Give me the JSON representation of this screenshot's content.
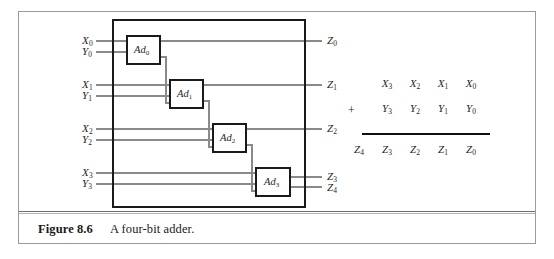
{
  "figure": {
    "caption_label": "Figure 8.6",
    "caption_text": "A four-bit adder.",
    "title": "A four-bit adder"
  },
  "colors": {
    "frame_border": "#9a9a9a",
    "rule_dark": "#6d6d6d",
    "rule_light": "#b4b4b4",
    "wire": "#888888",
    "block_border": "#1a1a1a",
    "text": "#1f1f1f"
  },
  "schematic": {
    "chip_label": "four-bit-adder-chip",
    "blocks": [
      {
        "name": "Ad",
        "index": "0",
        "label": "Ad0"
      },
      {
        "name": "Ad",
        "index": "1",
        "label": "Ad1"
      },
      {
        "name": "Ad",
        "index": "2",
        "label": "Ad2"
      },
      {
        "name": "Ad",
        "index": "3",
        "label": "Ad3"
      }
    ],
    "inputs": [
      {
        "name": "X",
        "index": "0"
      },
      {
        "name": "Y",
        "index": "0"
      },
      {
        "name": "X",
        "index": "1"
      },
      {
        "name": "Y",
        "index": "1"
      },
      {
        "name": "X",
        "index": "2"
      },
      {
        "name": "Y",
        "index": "2"
      },
      {
        "name": "X",
        "index": "3"
      },
      {
        "name": "Y",
        "index": "3"
      }
    ],
    "outputs": [
      {
        "name": "Z",
        "index": "0"
      },
      {
        "name": "Z",
        "index": "1"
      },
      {
        "name": "Z",
        "index": "2"
      },
      {
        "name": "Z",
        "index": "3"
      },
      {
        "name": "Z",
        "index": "4"
      }
    ]
  },
  "addition_table": {
    "operator": "+",
    "rows": [
      {
        "role": "augend",
        "cells": [
          {
            "text": "",
            "sub": ""
          },
          {
            "text": "X",
            "sub": "3"
          },
          {
            "text": "X",
            "sub": "2"
          },
          {
            "text": "X",
            "sub": "1"
          },
          {
            "text": "X",
            "sub": "0"
          }
        ]
      },
      {
        "role": "addend",
        "cells": [
          {
            "text": "",
            "sub": ""
          },
          {
            "text": "Y",
            "sub": "3"
          },
          {
            "text": "Y",
            "sub": "2"
          },
          {
            "text": "Y",
            "sub": "1"
          },
          {
            "text": "Y",
            "sub": "0"
          }
        ]
      },
      {
        "role": "sum",
        "cells": [
          {
            "text": "Z",
            "sub": "4"
          },
          {
            "text": "Z",
            "sub": "3"
          },
          {
            "text": "Z",
            "sub": "2"
          },
          {
            "text": "Z",
            "sub": "1"
          },
          {
            "text": "Z",
            "sub": "0"
          }
        ]
      }
    ]
  }
}
